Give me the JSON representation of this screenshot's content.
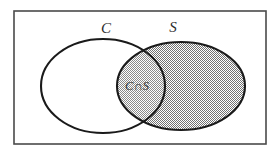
{
  "figure": {
    "type": "venn-diagram",
    "background_color": "#ffffff"
  },
  "universe": {
    "name": "universal-set-rectangle",
    "stroke_color": "#4a4a4a",
    "fill_color": "#ffffff",
    "x": 14,
    "y": 11,
    "width": 252,
    "height": 133
  },
  "sets": [
    {
      "id": "C",
      "label": "C",
      "label_x": 106,
      "label_y": 33,
      "shaded": false,
      "fill_color": "#ffffff",
      "stroke_color": "#1a1a1a",
      "cx": 103,
      "cy": 86,
      "rx": 62,
      "ry": 47
    },
    {
      "id": "S",
      "label": "S",
      "label_x": 173,
      "label_y": 32,
      "shaded": true,
      "fill_color": "#b4b4b4",
      "stroke_color": "#1a1a1a",
      "cx": 181,
      "cy": 86,
      "rx": 64,
      "ry": 44
    }
  ],
  "intersection": {
    "id": "C-and-S",
    "label": "C∩S",
    "label_x": 137,
    "label_y": 90,
    "shaded": true,
    "fill_color": "#c0c0c0"
  }
}
